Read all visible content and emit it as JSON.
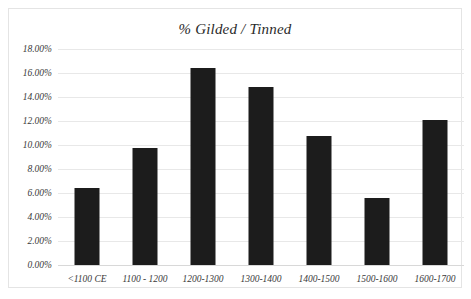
{
  "chart_data": {
    "type": "bar",
    "title": "% Gilded / Tinned",
    "xlabel": "",
    "ylabel": "",
    "categories": [
      "<1100 CE",
      "1100 - 1200",
      "1200-1300",
      "1300-1400",
      "1400-1500",
      "1500-1600",
      "1600-1700"
    ],
    "values": [
      6.4,
      9.75,
      16.4,
      14.85,
      10.75,
      5.6,
      12.1
    ],
    "value_labels": [
      "6.40%",
      "9.75%",
      "16.40%",
      "14.85%",
      "10.75%",
      "5.60%",
      "12.10%"
    ],
    "ylim": [
      0,
      18
    ],
    "ytick_values": [
      0,
      2,
      4,
      6,
      8,
      10,
      12,
      14,
      16,
      18
    ],
    "ytick_labels": [
      "0.00%",
      "2.00%",
      "4.00%",
      "6.00%",
      "8.00%",
      "10.00%",
      "12.00%",
      "14.00%",
      "16.00%",
      "18.00%"
    ],
    "grid": true,
    "legend": false,
    "bar_color": "#1c1c1c",
    "grid_color": "#e8e8e8",
    "background": "#ffffff"
  }
}
